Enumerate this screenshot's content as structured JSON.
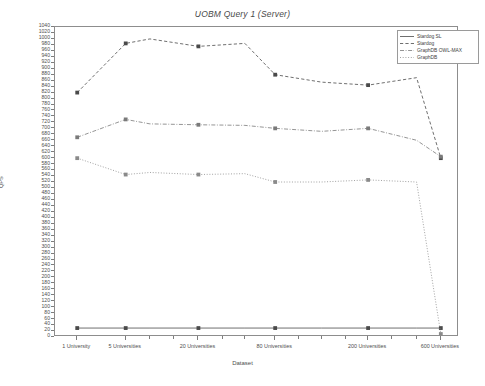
{
  "chart_data": {
    "type": "line",
    "title": "UOBM Query 1 (Server)",
    "xlabel": "Dataset",
    "ylabel": "QPS",
    "categories": [
      "1 University",
      "5 Universities",
      "20 Universities",
      "80 Universities",
      "200 Universities",
      "600 Universities"
    ],
    "x_tick_labels": [
      "1 University",
      "5 Universities",
      "20 Universities",
      "80 Universities",
      "200 Universities",
      "600 Universities"
    ],
    "ylim": [
      0,
      1040
    ],
    "y_tick_step": 20,
    "y_tick_labels": [
      "1040",
      "1020",
      "1000",
      "980",
      "960",
      "940",
      "920",
      "900",
      "880",
      "860",
      "840",
      "820",
      "800",
      "780",
      "760",
      "740",
      "720",
      "700",
      "680",
      "660",
      "640",
      "620",
      "600",
      "580",
      "560",
      "540",
      "520",
      "500",
      "480",
      "460",
      "440",
      "420",
      "400",
      "380",
      "360",
      "340",
      "320",
      "300",
      "280",
      "260",
      "240",
      "220",
      "200",
      "180",
      "160",
      "140",
      "120",
      "100",
      "80",
      "60",
      "40",
      "20",
      "0"
    ],
    "grid": false,
    "legend_position": "top-right",
    "series": [
      {
        "name": "Stardog SL",
        "style": "solid",
        "color": "#4a4a4a",
        "marker": "square",
        "values": [
          30,
          30,
          30,
          30,
          30,
          30
        ]
      },
      {
        "name": "Stardog",
        "style": "dashed",
        "color": "#4a4a4a",
        "marker": "square",
        "values": [
          820,
          985,
          1000,
          975,
          985,
          600
        ]
      },
      {
        "name": "GraphDB OWL-MAX",
        "style": "dash-dot",
        "color": "#7a7a7a",
        "marker": "square",
        "values": [
          670,
          730,
          715,
          710,
          700,
          605
        ]
      },
      {
        "name": "GraphDB",
        "style": "dotted",
        "color": "#8a8a8a",
        "marker": "square",
        "values": [
          600,
          545,
          550,
          545,
          520,
          10
        ]
      }
    ],
    "extra_points": {
      "note": "Dense sampling between labelled categories as drawn in the figure",
      "x_fraction": [
        0.055,
        0.175,
        0.235,
        0.355,
        0.47,
        0.545,
        0.66,
        0.775,
        0.895,
        0.955
      ],
      "stardog": [
        820,
        985,
        1000,
        975,
        985,
        880,
        855,
        845,
        870,
        600
      ],
      "graphdb_owlmax": [
        670,
        730,
        715,
        712,
        710,
        700,
        690,
        700,
        660,
        605
      ],
      "graphdb": [
        600,
        545,
        552,
        545,
        548,
        520,
        520,
        527,
        520,
        10
      ],
      "stardog_sl": [
        30,
        30,
        30,
        30,
        30,
        30,
        30,
        30,
        30,
        30
      ]
    }
  },
  "legend": {
    "entries": [
      {
        "label": "Stardog SL"
      },
      {
        "label": "Stardog"
      },
      {
        "label": "GraphDB OWL-MAX"
      },
      {
        "label": "GraphDB"
      }
    ]
  }
}
